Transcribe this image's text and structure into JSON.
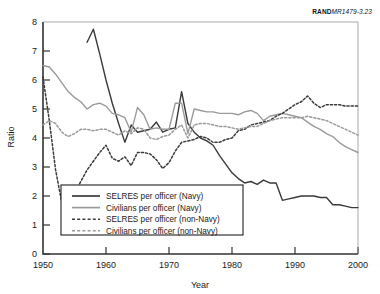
{
  "figure": {
    "source_id_prefix": "RAND",
    "source_id_number": "MR1479-3.23"
  },
  "chart_data": {
    "type": "line",
    "title": "",
    "xlabel": "Year",
    "ylabel": "Ratio",
    "xlim": [
      1950,
      2000
    ],
    "ylim": [
      0,
      8
    ],
    "xticks": [
      1950,
      1960,
      1970,
      1980,
      1990,
      2000
    ],
    "yticks": [
      0,
      1,
      2,
      3,
      4,
      5,
      6,
      7,
      8
    ],
    "grid": false,
    "legend_position": "lower-left-inside",
    "colors": {
      "navy_selres": "#3a3a3a",
      "navy_civilians": "#9a9a9a",
      "nonnavy_selres": "#3a3a3a",
      "nonnavy_civilians": "#9a9a9a",
      "axis": "#333333",
      "background": "#ffffff"
    },
    "series": [
      {
        "name": "SELRES per officer (Navy)",
        "style": "solid",
        "color": "#3a3a3a",
        "x": [
          1957,
          1958,
          1959,
          1960,
          1961,
          1962,
          1963,
          1964,
          1965,
          1966,
          1967,
          1968,
          1969,
          1970,
          1971,
          1972,
          1973,
          1974,
          1975,
          1976,
          1977,
          1978,
          1979,
          1980,
          1981,
          1982,
          1983,
          1984,
          1985,
          1986,
          1987,
          1988,
          1989,
          1990,
          1991,
          1992,
          1993,
          1994,
          1995,
          1996,
          1997,
          1998,
          1999,
          2000
        ],
        "values": [
          7.3,
          7.75,
          6.9,
          6.0,
          5.2,
          4.5,
          3.85,
          4.45,
          4.2,
          4.25,
          4.3,
          4.55,
          4.2,
          4.3,
          4.35,
          5.6,
          4.5,
          4.2,
          4.0,
          3.9,
          3.75,
          3.4,
          3.1,
          2.8,
          2.6,
          2.45,
          2.5,
          2.4,
          2.55,
          2.45,
          2.45,
          1.85,
          1.9,
          1.95,
          2.0,
          2.0,
          2.0,
          1.95,
          1.95,
          1.7,
          1.7,
          1.65,
          1.6,
          1.6
        ]
      },
      {
        "name": "Civilians per officer (Navy)",
        "style": "solid",
        "color": "#9a9a9a",
        "x": [
          1950,
          1951,
          1952,
          1953,
          1954,
          1955,
          1956,
          1957,
          1958,
          1959,
          1960,
          1961,
          1962,
          1963,
          1964,
          1965,
          1966,
          1967,
          1968,
          1969,
          1970,
          1971,
          1972,
          1973,
          1974,
          1975,
          1976,
          1977,
          1978,
          1979,
          1980,
          1981,
          1982,
          1983,
          1984,
          1985,
          1986,
          1987,
          1988,
          1989,
          1990,
          1991,
          1992,
          1993,
          1994,
          1995,
          1996,
          1997,
          1998,
          1999,
          2000
        ],
        "values": [
          6.5,
          6.45,
          6.2,
          5.9,
          5.6,
          5.4,
          5.25,
          5.0,
          5.15,
          5.2,
          5.1,
          4.85,
          4.8,
          4.7,
          4.2,
          5.05,
          4.8,
          4.3,
          4.35,
          4.3,
          4.3,
          5.2,
          5.2,
          4.15,
          5.0,
          4.95,
          4.9,
          4.9,
          4.85,
          4.85,
          4.85,
          4.8,
          4.9,
          4.95,
          4.85,
          4.6,
          4.75,
          4.8,
          4.85,
          4.8,
          4.75,
          4.7,
          4.55,
          4.4,
          4.3,
          4.15,
          4.05,
          3.85,
          3.7,
          3.6,
          3.5
        ]
      },
      {
        "name": "SELRES per officer (non-Navy)",
        "style": "dashed",
        "color": "#3a3a3a",
        "x": [
          1950,
          1951,
          1952,
          1953,
          1954,
          1955,
          1956,
          1957,
          1958,
          1959,
          1960,
          1961,
          1962,
          1963,
          1964,
          1965,
          1966,
          1967,
          1968,
          1969,
          1970,
          1971,
          1972,
          1973,
          1974,
          1975,
          1976,
          1977,
          1978,
          1979,
          1980,
          1981,
          1982,
          1983,
          1984,
          1985,
          1986,
          1987,
          1988,
          1989,
          1990,
          1991,
          1992,
          1993,
          1994,
          1995,
          1996,
          1997,
          1998,
          1999,
          2000
        ],
        "values": [
          6.1,
          4.6,
          2.9,
          1.75,
          1.65,
          2.1,
          2.5,
          2.9,
          3.2,
          3.5,
          3.75,
          3.3,
          3.2,
          3.35,
          3.05,
          3.5,
          3.5,
          3.45,
          3.25,
          2.95,
          3.15,
          3.55,
          3.85,
          3.9,
          3.95,
          4.05,
          4.0,
          3.85,
          3.85,
          3.95,
          4.0,
          4.25,
          4.3,
          4.45,
          4.5,
          4.55,
          4.6,
          4.75,
          4.85,
          5.0,
          5.15,
          5.25,
          5.45,
          5.2,
          5.05,
          5.15,
          5.15,
          5.15,
          5.1,
          5.1,
          5.1
        ]
      },
      {
        "name": "Civilians per officer (non-Navy)",
        "style": "dashed",
        "color": "#9a9a9a",
        "x": [
          1950,
          1951,
          1952,
          1953,
          1954,
          1955,
          1956,
          1957,
          1958,
          1959,
          1960,
          1961,
          1962,
          1963,
          1964,
          1965,
          1966,
          1967,
          1968,
          1969,
          1970,
          1971,
          1972,
          1973,
          1974,
          1975,
          1976,
          1977,
          1978,
          1979,
          1980,
          1981,
          1982,
          1983,
          1984,
          1985,
          1986,
          1987,
          1988,
          1989,
          1990,
          1991,
          1992,
          1993,
          1994,
          1995,
          1996,
          1997,
          1998,
          1999,
          2000
        ],
        "values": [
          4.45,
          4.6,
          4.5,
          4.2,
          4.05,
          4.15,
          4.3,
          4.3,
          4.25,
          4.3,
          4.3,
          4.2,
          4.1,
          4.25,
          4.15,
          4.35,
          4.3,
          4.0,
          3.95,
          4.05,
          4.1,
          4.3,
          4.45,
          4.0,
          4.45,
          4.5,
          4.5,
          4.45,
          4.4,
          4.4,
          4.35,
          4.3,
          4.35,
          4.4,
          4.4,
          4.5,
          4.6,
          4.65,
          4.7,
          4.7,
          4.7,
          4.7,
          4.75,
          4.7,
          4.65,
          4.6,
          4.5,
          4.4,
          4.3,
          4.2,
          4.1
        ]
      }
    ],
    "legend": [
      {
        "label": "SELRES per officer (Navy)",
        "style": "solid",
        "color": "#3a3a3a"
      },
      {
        "label": "Civilians per officer (Navy)",
        "style": "solid",
        "color": "#9a9a9a"
      },
      {
        "label": "SELRES per officer (non-Navy)",
        "style": "dashed",
        "color": "#3a3a3a"
      },
      {
        "label": "Civilians per officer (non-Navy)",
        "style": "dashed",
        "color": "#9a9a9a"
      }
    ]
  }
}
